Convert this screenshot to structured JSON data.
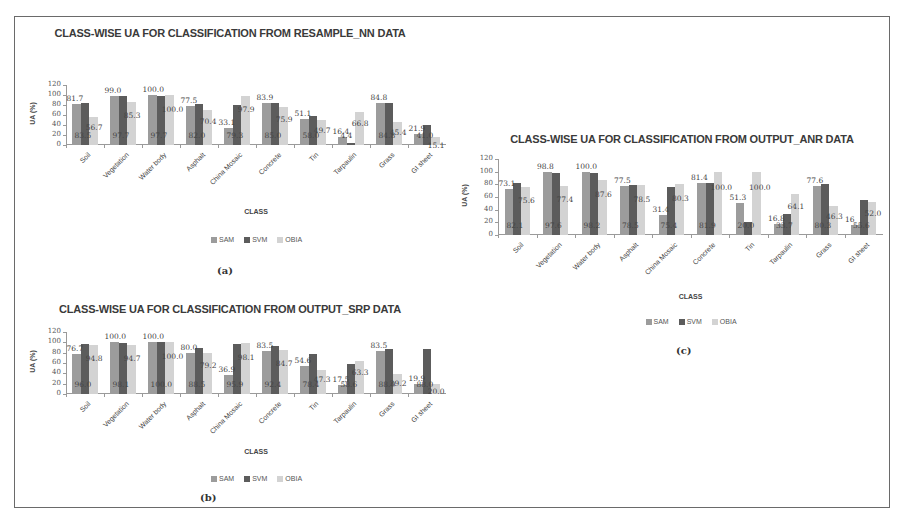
{
  "figure": {
    "captions": [
      "(a)",
      "(b)",
      "(c)"
    ]
  },
  "legend": {
    "series": [
      {
        "name": "SAM",
        "color": "#9c9c9c"
      },
      {
        "name": "SVM",
        "color": "#5c5c5c"
      },
      {
        "name": "OBIA",
        "color": "#d3d3d3"
      }
    ]
  },
  "axes": {
    "ylabel": "UA (%)",
    "xlabel": "CLASS",
    "yticks": [
      "0",
      "20",
      "40",
      "60",
      "80",
      "100",
      "120"
    ]
  },
  "chart_data": [
    {
      "id": "a",
      "type": "bar",
      "title": "CLASS-WISE UA FOR CLASSIFICATION FROM RESAMPLE_NN DATA",
      "xlabel": "CLASS",
      "ylabel": "UA (%)",
      "ylim": [
        0,
        120
      ],
      "grid": false,
      "legend_position": "bottom",
      "caption": "(a)",
      "categories": [
        "Soil",
        "Vegetation",
        "Water body",
        "Asphalt",
        "China Mosaic",
        "Concrete",
        "Tin",
        "Tarpaulin",
        "Grass",
        "GI sheet"
      ],
      "series": [
        {
          "name": "SAM",
          "values": [
            81.7,
            99.0,
            100.0,
            77.5,
            33.1,
            83.9,
            51.1,
            16.4,
            84.8,
            21.9
          ]
        },
        {
          "name": "SVM",
          "values": [
            83.5,
            97.7,
            97.7,
            82.0,
            79.3,
            85.0,
            58.0,
            4.4,
            84.8,
            41.0
          ]
        },
        {
          "name": "OBIA",
          "values": [
            56.7,
            85.3,
            100.0,
            70.4,
            97.9,
            75.9,
            49.7,
            66.8,
            45.4,
            15.1
          ]
        }
      ],
      "bar_labels": {
        "SAM": [
          "81.7",
          "99.0",
          "100.0",
          "77.5",
          "33.1",
          "83.9",
          "51.1",
          "16.4",
          "84.8",
          "21.9"
        ],
        "SVM": [
          "83.5",
          "97.7",
          "97.7",
          "82.0",
          "79.3",
          "85.0",
          "58.0",
          "4.4",
          "84.8",
          "41.0"
        ],
        "OBIA": [
          "56.7",
          "85.3",
          "100.0",
          "70.4",
          "97.9",
          "75.9",
          "49.7",
          "66.8",
          "45.4",
          "15.1"
        ]
      }
    },
    {
      "id": "b",
      "type": "bar",
      "title": "CLASS-WISE UA FOR CLASSIFICATION FROM OUTPUT_SRP DATA",
      "xlabel": "CLASS",
      "ylabel": "UA (%)",
      "ylim": [
        0,
        120
      ],
      "grid": false,
      "legend_position": "bottom",
      "caption": "(b)",
      "categories": [
        "Soil",
        "Vegetation",
        "Water body",
        "Asphalt",
        "China Mosaic",
        "Concrete",
        "Tin",
        "Tarpaulin",
        "Grass",
        "GI sheet"
      ],
      "series": [
        {
          "name": "SAM",
          "values": [
            76.7,
            100.0,
            100.0,
            80.0,
            36.9,
            83.5,
            54.6,
            17.5,
            83.5,
            19.9
          ]
        },
        {
          "name": "SVM",
          "values": [
            96.0,
            98.1,
            100.0,
            88.5,
            95.9,
            92.4,
            78.4,
            58.6,
            88.0,
            88.0
          ]
        },
        {
          "name": "OBIA",
          "values": [
            94.8,
            94.7,
            100.0,
            79.2,
            98.1,
            84.7,
            47.3,
            63.3,
            39.2,
            20.0
          ]
        }
      ],
      "bar_labels": {
        "SAM": [
          "76.7",
          "100.0",
          "100.0",
          "80.0",
          "36.9",
          "83.5",
          "54.6",
          "17.5",
          "83.5",
          "19.9"
        ],
        "SVM": [
          "96.0",
          "98.1",
          "100.0",
          "88.5",
          "95.9",
          "92.4",
          "78.4",
          "58.6",
          "88.0",
          "88.0"
        ],
        "OBIA": [
          "94.8",
          "94.7",
          "100.0",
          "79.2",
          "98.1",
          "84.7",
          "47.3",
          "63.3",
          "39.2",
          "20.0"
        ]
      }
    },
    {
      "id": "c",
      "type": "bar",
      "title": "CLASS-WISE UA FOR CLASSIFICATION FROM OUTPUT_ANR DATA",
      "xlabel": "CLASS",
      "ylabel": "UA (%)",
      "ylim": [
        0,
        120
      ],
      "grid": false,
      "legend_position": "bottom",
      "caption": "(c)",
      "categories": [
        "Soil",
        "Vegetation",
        "Water body",
        "Asphalt",
        "China Mosaic",
        "Concrete",
        "Tin",
        "Tarpaulin",
        "Grass",
        "GI sheet"
      ],
      "series": [
        {
          "name": "SAM",
          "values": [
            73.1,
            98.8,
            100.0,
            77.5,
            31.4,
            81.4,
            51.3,
            16.8,
            77.6,
            16.0
          ]
        },
        {
          "name": "SVM",
          "values": [
            82.1,
            97.6,
            98.2,
            78.5,
            75.4,
            81.9,
            20.0,
            33.7,
            80.3,
            55.6
          ]
        },
        {
          "name": "OBIA",
          "values": [
            75.6,
            77.4,
            87.6,
            78.5,
            80.3,
            100.0,
            100.0,
            64.1,
            46.3,
            52.0
          ]
        }
      ],
      "bar_labels": {
        "SAM": [
          "73.1",
          "98.8",
          "100.0",
          "77.5",
          "31.4",
          "81.4",
          "51.3",
          "16.8",
          "77.6",
          "16"
        ],
        "SVM": [
          "82.1",
          "97.6",
          "98.2",
          "78.5",
          "75.4",
          "81.9",
          "20.0",
          "33.7",
          "80.3",
          "55.6"
        ],
        "OBIA": [
          "75.6",
          "77.4",
          "87.6",
          "78.5",
          "80.3",
          "100.0",
          "100.0",
          "64.1",
          "46.3",
          "52.0"
        ]
      }
    }
  ]
}
